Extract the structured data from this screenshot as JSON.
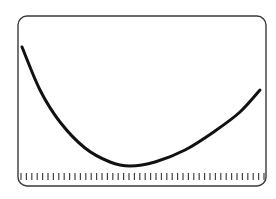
{
  "diagram": {
    "frame": {
      "x": 18,
      "y": 16,
      "width": 248,
      "height": 170,
      "radius": 9,
      "stroke": "#3a3a3a"
    },
    "curve": {
      "color": "#111111",
      "width": 3,
      "points": [
        [
          22,
          47
        ],
        [
          40,
          90
        ],
        [
          60,
          122
        ],
        [
          85,
          148
        ],
        [
          110,
          162
        ],
        [
          130,
          166
        ],
        [
          155,
          162
        ],
        [
          185,
          150
        ],
        [
          215,
          131
        ],
        [
          240,
          112
        ],
        [
          260,
          90
        ]
      ]
    },
    "ticks": {
      "count": 46,
      "x_start": 21,
      "x_end": 264,
      "y_top": 173,
      "y_bottom": 180,
      "color": "#444444"
    }
  }
}
